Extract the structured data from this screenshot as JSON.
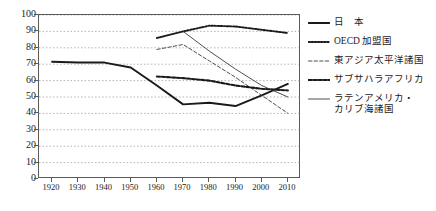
{
  "chart_data": {
    "type": "line",
    "title": "",
    "subtitle": "",
    "xlabel": "",
    "ylabel": "",
    "x": [
      1920,
      1930,
      1940,
      1950,
      1960,
      1970,
      1980,
      1990,
      2000,
      2010
    ],
    "xlim": [
      1915,
      2015
    ],
    "ylim": [
      0,
      100
    ],
    "ytick_step": 10,
    "grid": "horizontal-dotted",
    "legend_position": "right",
    "series": [
      {
        "name": "日　本",
        "style": "solid-thick",
        "color": "#1a1a1a",
        "x": [
          1920,
          1930,
          1940,
          1950,
          1960,
          1970,
          1980,
          1990,
          2000,
          2010
        ],
        "values": [
          71.5,
          71.0,
          71.0,
          68.0,
          57.0,
          45.5,
          46.5,
          44.5,
          51.0,
          58.0
        ]
      },
      {
        "name": "OECD 加盟国",
        "style": "dotted",
        "color": "#1a1a1a",
        "x": [
          1960,
          1970,
          1980,
          1990,
          2000,
          2010
        ],
        "values": [
          86.0,
          90.0,
          93.5,
          93.0,
          91.0,
          89.0
        ]
      },
      {
        "name": "東アジア太平洋諸国",
        "style": "dashed-thin",
        "color": "#3a3a3a",
        "x": [
          1960,
          1970,
          1980,
          1990,
          2000,
          2010
        ],
        "values": [
          79.0,
          82.0,
          72.0,
          62.0,
          51.0,
          40.0
        ]
      },
      {
        "name": "サブサハラアフリカ",
        "style": "dotted-bold",
        "color": "#1a1a1a",
        "x": [
          1960,
          1970,
          1980,
          1990,
          2000,
          2010
        ],
        "values": [
          62.5,
          61.5,
          60.0,
          57.0,
          55.0,
          54.0
        ]
      },
      {
        "name": "ラテンアメリカ・\nカリブ海諸国",
        "style": "solid-thin",
        "color": "#3a3a3a",
        "x": [
          1970,
          1980,
          1990,
          2000,
          2010
        ],
        "values": [
          90.0,
          78.0,
          67.0,
          57.0,
          50.0
        ]
      }
    ],
    "ytick_labels": [
      "100",
      "90",
      "80",
      "70",
      "60",
      "50",
      "40",
      "30",
      "20",
      "10",
      "0"
    ],
    "xtick_labels": [
      "1920",
      "1930",
      "1940",
      "1950",
      "1960",
      "1970",
      "1980",
      "1990",
      "2000",
      "2010"
    ]
  },
  "legend": {
    "items": [
      {
        "label": "日　本",
        "swatch": "solid-thick-line-icon"
      },
      {
        "label": "OECD 加盟国",
        "swatch": "dotted-line-icon"
      },
      {
        "label": "東アジア太平洋諸国",
        "swatch": "dashed-line-icon"
      },
      {
        "label": "サブサハラアフリカ",
        "swatch": "dotted-bold-line-icon"
      },
      {
        "label": "ラテンアメリカ・\nカリブ海諸国",
        "swatch": "solid-thin-line-icon"
      }
    ]
  }
}
